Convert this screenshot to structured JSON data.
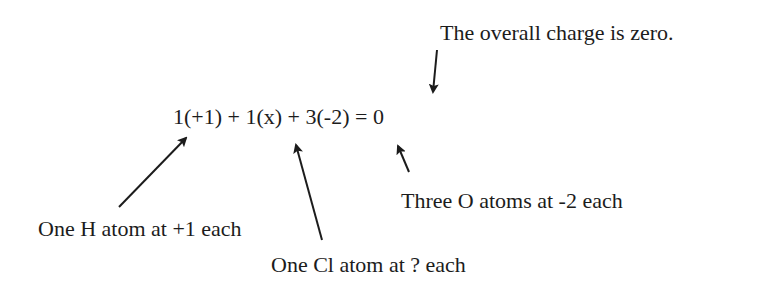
{
  "diagram": {
    "equation": "1(+1) + 1(x) + 3(-2) = 0",
    "annotations": {
      "overall_charge": "The overall charge is zero.",
      "hydrogen": "One H atom at +1 each",
      "chlorine": "One Cl atom at ? each",
      "oxygen": "Three O atoms at -2 each"
    },
    "colors": {
      "text": "#1c1c1c",
      "arrow": "#1c1c1c",
      "background": "#ffffff"
    }
  }
}
